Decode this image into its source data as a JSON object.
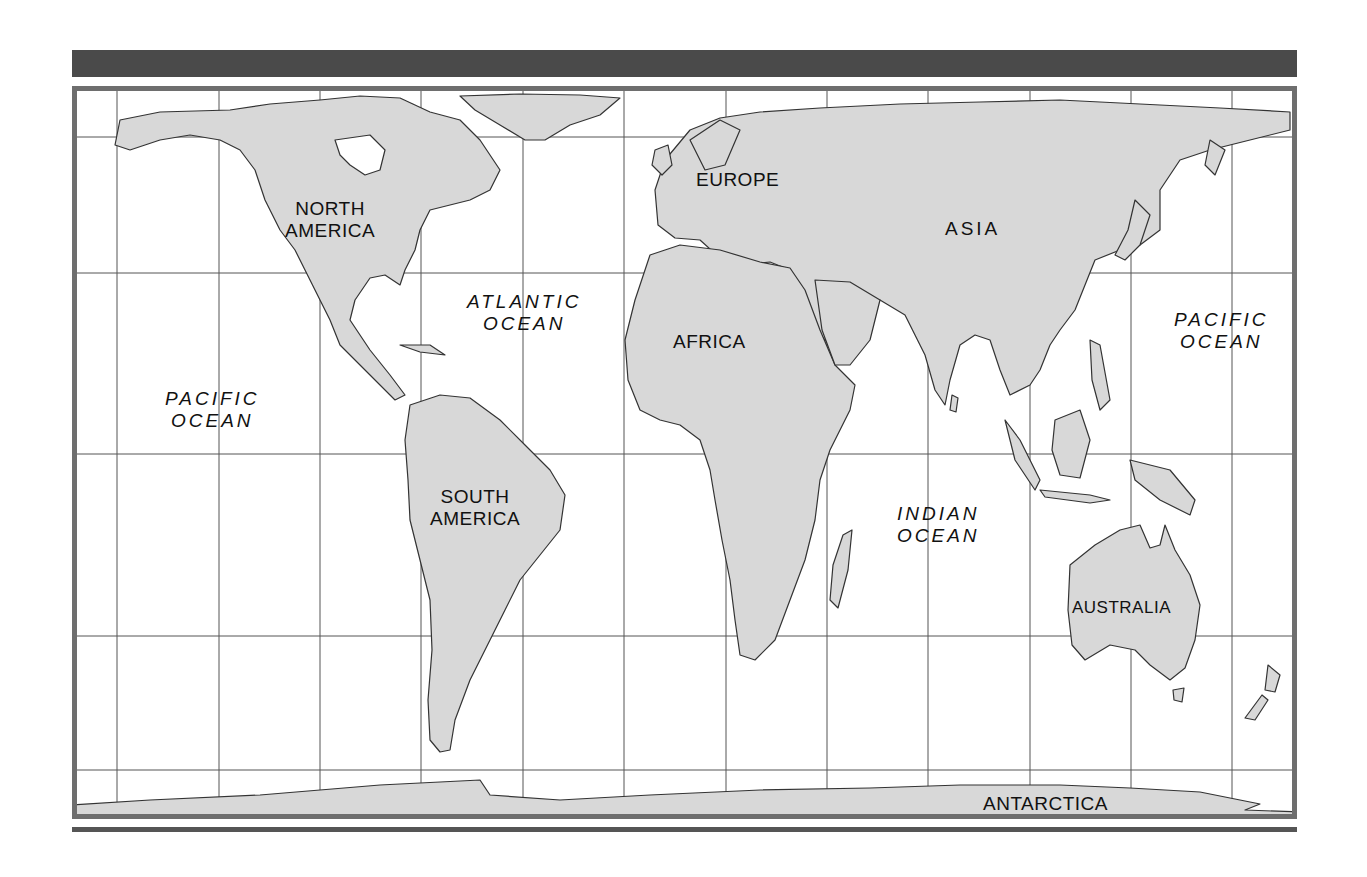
{
  "map": {
    "title": "World Map",
    "land_color": "#d8d8d8",
    "outline_color": "#333333",
    "grid_color": "#555555",
    "frame_color": "#6e6e6e",
    "bar_color": "#4a4a4a",
    "continents": {
      "north_america": {
        "line1": "NORTH",
        "line2": "AMERICA"
      },
      "south_america": {
        "line1": "SOUTH",
        "line2": "AMERICA"
      },
      "europe": "EUROPE",
      "africa": "AFRICA",
      "asia": "ASIA",
      "australia": "AUSTRALIA",
      "antarctica": "ANTARCTICA"
    },
    "oceans": {
      "pacific_west": {
        "line1": "PACIFIC",
        "line2": "OCEAN"
      },
      "atlantic": {
        "line1": "ATLANTIC",
        "line2": "OCEAN"
      },
      "indian": {
        "line1": "INDIAN",
        "line2": "OCEAN"
      },
      "pacific_east": {
        "line1": "PACIFIC",
        "line2": "OCEAN"
      }
    }
  }
}
